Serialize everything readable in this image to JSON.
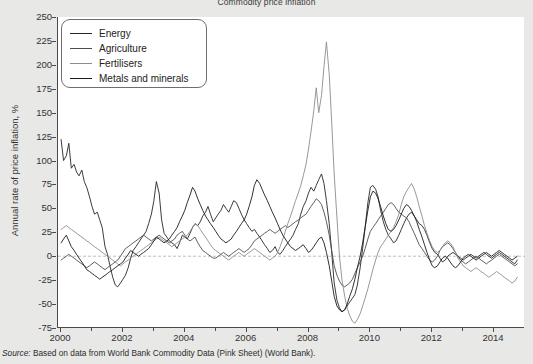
{
  "figure": {
    "title": "Commodity price inflation",
    "source_prefix": "Source:",
    "source_text": " Based on data from World Bank Commodity Data (Pink Sheet) (World Bank)."
  },
  "legend": {
    "position": "top-left",
    "items": [
      {
        "label": "Energy",
        "color": "#262626"
      },
      {
        "label": "Agriculture",
        "color": "#4d4d4d"
      },
      {
        "label": "Fertilisers",
        "color": "#8c8c8c"
      },
      {
        "label": "Metals and minerals",
        "color": "#1a1a1a"
      }
    ]
  },
  "axes": {
    "ylabel": "Annual rate of price inflation, %",
    "xlabel": "",
    "yticks": [
      250,
      225,
      200,
      175,
      150,
      125,
      100,
      75,
      50,
      25,
      0,
      -25,
      -50,
      -75
    ],
    "ytick_labels": [
      "250",
      "225",
      "200",
      "175",
      "150",
      "125",
      "100",
      "75",
      "50",
      "25",
      "0",
      "-25",
      "-50",
      "-75"
    ],
    "xticks": [
      2000,
      2002,
      2004,
      2006,
      2008,
      2010,
      2012,
      2014
    ],
    "xtick_labels": [
      "2000",
      "2002",
      "2004",
      "2006",
      "2008",
      "2010",
      "2012",
      "2014"
    ],
    "xminor": [
      2001,
      2003,
      2005,
      2007,
      2009,
      2011,
      2013
    ],
    "ylim": [
      -75,
      250
    ],
    "xlim": [
      1999.9,
      2015.0
    ],
    "grid": false,
    "zero_line": true,
    "zero_line_color": "#b0b0b0"
  },
  "chart_data": {
    "type": "line",
    "title": "Commodity price inflation",
    "xlabel": "",
    "ylabel": "Annual rate of price inflation, %",
    "ylim": [
      -75,
      250
    ],
    "xlim": [
      1999.9,
      2015.0
    ],
    "grid": false,
    "legend_position": "top-left",
    "x_unit": "year (monthly observations)",
    "x": [
      2000.0,
      2000.08,
      2000.17,
      2000.25,
      2000.33,
      2000.42,
      2000.5,
      2000.58,
      2000.67,
      2000.75,
      2000.83,
      2000.92,
      2001.0,
      2001.08,
      2001.17,
      2001.25,
      2001.33,
      2001.42,
      2001.5,
      2001.58,
      2001.67,
      2001.75,
      2001.83,
      2001.92,
      2002.0,
      2002.08,
      2002.17,
      2002.25,
      2002.33,
      2002.42,
      2002.5,
      2002.58,
      2002.67,
      2002.75,
      2002.83,
      2002.92,
      2003.0,
      2003.08,
      2003.17,
      2003.25,
      2003.33,
      2003.42,
      2003.5,
      2003.58,
      2003.67,
      2003.75,
      2003.83,
      2003.92,
      2004.0,
      2004.08,
      2004.17,
      2004.25,
      2004.33,
      2004.42,
      2004.5,
      2004.58,
      2004.67,
      2004.75,
      2004.83,
      2004.92,
      2005.0,
      2005.08,
      2005.17,
      2005.25,
      2005.33,
      2005.42,
      2005.5,
      2005.58,
      2005.67,
      2005.75,
      2005.83,
      2005.92,
      2006.0,
      2006.08,
      2006.17,
      2006.25,
      2006.33,
      2006.42,
      2006.5,
      2006.58,
      2006.67,
      2006.75,
      2006.83,
      2006.92,
      2007.0,
      2007.08,
      2007.17,
      2007.25,
      2007.33,
      2007.42,
      2007.5,
      2007.58,
      2007.67,
      2007.75,
      2007.83,
      2007.92,
      2008.0,
      2008.08,
      2008.17,
      2008.25,
      2008.33,
      2008.42,
      2008.5,
      2008.58,
      2008.67,
      2008.75,
      2008.83,
      2008.92,
      2009.0,
      2009.08,
      2009.17,
      2009.25,
      2009.33,
      2009.42,
      2009.5,
      2009.58,
      2009.67,
      2009.75,
      2009.83,
      2009.92,
      2010.0,
      2010.08,
      2010.17,
      2010.25,
      2010.33,
      2010.42,
      2010.5,
      2010.58,
      2010.67,
      2010.75,
      2010.83,
      2010.92,
      2011.0,
      2011.08,
      2011.17,
      2011.25,
      2011.33,
      2011.42,
      2011.5,
      2011.58,
      2011.67,
      2011.75,
      2011.83,
      2011.92,
      2012.0,
      2012.08,
      2012.17,
      2012.25,
      2012.33,
      2012.42,
      2012.5,
      2012.58,
      2012.67,
      2012.75,
      2012.83,
      2012.92,
      2013.0,
      2013.08,
      2013.17,
      2013.25,
      2013.33,
      2013.42,
      2013.5,
      2013.58,
      2013.67,
      2013.75,
      2013.83,
      2013.92,
      2014.0,
      2014.08,
      2014.17,
      2014.25,
      2014.33,
      2014.42,
      2014.5,
      2014.58,
      2014.67,
      2014.75
    ],
    "series": [
      {
        "name": "Energy",
        "color": "#262626",
        "values": [
          122,
          100,
          105,
          118,
          92,
          96,
          88,
          84,
          90,
          78,
          72,
          62,
          52,
          44,
          46,
          38,
          30,
          10,
          2,
          -10,
          -22,
          -30,
          -32,
          -28,
          -24,
          -20,
          -12,
          -2,
          6,
          10,
          14,
          18,
          22,
          26,
          34,
          44,
          58,
          78,
          66,
          38,
          24,
          20,
          16,
          14,
          12,
          8,
          14,
          22,
          20,
          18,
          24,
          30,
          34,
          32,
          36,
          42,
          46,
          52,
          44,
          36,
          40,
          44,
          48,
          54,
          50,
          46,
          52,
          58,
          56,
          50,
          44,
          38,
          34,
          30,
          26,
          28,
          24,
          20,
          16,
          12,
          8,
          4,
          6,
          10,
          4,
          2,
          6,
          10,
          14,
          18,
          22,
          28,
          34,
          44,
          52,
          58,
          66,
          72,
          68,
          74,
          80,
          86,
          76,
          58,
          34,
          4,
          -28,
          -46,
          -54,
          -58,
          -56,
          -52,
          -48,
          -44,
          -40,
          -30,
          -12,
          8,
          30,
          56,
          72,
          74,
          70,
          62,
          48,
          36,
          28,
          22,
          18,
          14,
          16,
          22,
          28,
          34,
          40,
          44,
          46,
          42,
          38,
          34,
          32,
          28,
          22,
          14,
          8,
          4,
          2,
          -2,
          -6,
          -4,
          0,
          2,
          4,
          2,
          0,
          -2,
          -4,
          -2,
          0,
          2,
          0,
          -2,
          0,
          2,
          4,
          2,
          0,
          -2,
          0,
          2,
          4,
          2,
          0,
          -2,
          -4,
          -6,
          -8,
          -4
        ]
      },
      {
        "name": "Agriculture",
        "color": "#4d4d4d",
        "values": [
          -4,
          -2,
          0,
          2,
          0,
          -2,
          -4,
          -6,
          -8,
          -10,
          -12,
          -10,
          -8,
          -6,
          -8,
          -10,
          -12,
          -14,
          -12,
          -10,
          -8,
          -6,
          -4,
          0,
          4,
          8,
          10,
          12,
          14,
          16,
          18,
          20,
          22,
          20,
          18,
          16,
          18,
          20,
          22,
          20,
          18,
          16,
          14,
          16,
          18,
          22,
          24,
          26,
          22,
          18,
          16,
          18,
          20,
          14,
          10,
          6,
          4,
          2,
          0,
          -2,
          -2,
          0,
          2,
          4,
          2,
          0,
          2,
          4,
          6,
          8,
          6,
          4,
          6,
          8,
          12,
          16,
          18,
          20,
          22,
          24,
          26,
          28,
          26,
          24,
          26,
          28,
          30,
          32,
          30,
          32,
          34,
          36,
          38,
          40,
          42,
          44,
          48,
          52,
          56,
          60,
          58,
          54,
          46,
          36,
          22,
          6,
          -10,
          -20,
          -26,
          -30,
          -32,
          -30,
          -28,
          -24,
          -18,
          -12,
          -6,
          0,
          8,
          18,
          26,
          30,
          34,
          38,
          42,
          46,
          50,
          54,
          56,
          54,
          50,
          46,
          44,
          42,
          40,
          36,
          30,
          24,
          18,
          12,
          8,
          4,
          0,
          -4,
          -6,
          -4,
          0,
          6,
          10,
          12,
          14,
          12,
          8,
          4,
          0,
          -4,
          -6,
          -8,
          -6,
          -4,
          -2,
          0,
          -2,
          -4,
          -6,
          -8,
          -6,
          -4,
          -2,
          0,
          2,
          0,
          -2,
          -4,
          -6,
          -8,
          -10,
          -8
        ]
      },
      {
        "name": "Fertilisers",
        "color": "#8c8c8c",
        "values": [
          28,
          30,
          32,
          30,
          28,
          26,
          24,
          22,
          20,
          18,
          16,
          14,
          12,
          10,
          8,
          6,
          4,
          2,
          0,
          -2,
          -4,
          -6,
          -8,
          -10,
          -8,
          -6,
          -4,
          -2,
          0,
          2,
          4,
          6,
          8,
          10,
          12,
          14,
          16,
          18,
          20,
          18,
          16,
          14,
          12,
          10,
          12,
          14,
          16,
          18,
          20,
          22,
          26,
          30,
          34,
          32,
          28,
          24,
          20,
          16,
          12,
          8,
          6,
          4,
          2,
          0,
          -2,
          -4,
          -2,
          0,
          2,
          4,
          2,
          0,
          2,
          4,
          6,
          8,
          6,
          4,
          2,
          0,
          -2,
          -4,
          -2,
          0,
          4,
          10,
          18,
          26,
          34,
          42,
          50,
          58,
          66,
          74,
          84,
          96,
          112,
          130,
          152,
          176,
          150,
          168,
          198,
          224,
          190,
          140,
          86,
          40,
          0,
          -24,
          -42,
          -54,
          -62,
          -68,
          -70,
          -66,
          -60,
          -52,
          -44,
          -34,
          -24,
          -14,
          -4,
          4,
          10,
          14,
          18,
          22,
          26,
          30,
          36,
          44,
          54,
          62,
          68,
          72,
          76,
          70,
          62,
          52,
          42,
          32,
          24,
          16,
          10,
          6,
          4,
          6,
          10,
          14,
          16,
          14,
          10,
          4,
          -2,
          -6,
          -10,
          -12,
          -14,
          -16,
          -14,
          -12,
          -14,
          -16,
          -18,
          -20,
          -22,
          -20,
          -18,
          -16,
          -18,
          -20,
          -22,
          -24,
          -26,
          -28,
          -26,
          -22
        ]
      },
      {
        "name": "Metals and minerals",
        "color": "#1a1a1a",
        "values": [
          14,
          18,
          22,
          16,
          10,
          6,
          2,
          -2,
          -6,
          -10,
          -14,
          -16,
          -18,
          -20,
          -22,
          -24,
          -22,
          -20,
          -18,
          -16,
          -14,
          -12,
          -10,
          -8,
          -6,
          -2,
          2,
          6,
          4,
          2,
          0,
          2,
          4,
          6,
          8,
          12,
          16,
          20,
          18,
          16,
          14,
          16,
          18,
          22,
          26,
          30,
          36,
          42,
          48,
          56,
          64,
          72,
          68,
          60,
          54,
          48,
          42,
          38,
          34,
          30,
          26,
          22,
          18,
          16,
          14,
          16,
          18,
          22,
          26,
          30,
          34,
          38,
          44,
          52,
          62,
          74,
          80,
          76,
          70,
          64,
          58,
          52,
          46,
          40,
          34,
          28,
          22,
          18,
          14,
          10,
          8,
          6,
          8,
          10,
          12,
          8,
          4,
          6,
          10,
          14,
          18,
          20,
          14,
          4,
          -10,
          -26,
          -42,
          -52,
          -56,
          -58,
          -56,
          -50,
          -42,
          -34,
          -24,
          -12,
          0,
          14,
          30,
          48,
          62,
          68,
          66,
          60,
          52,
          42,
          34,
          28,
          26,
          28,
          32,
          38,
          44,
          50,
          54,
          52,
          48,
          42,
          36,
          28,
          20,
          12,
          4,
          -4,
          -10,
          -12,
          -10,
          -6,
          -2,
          0,
          -2,
          -6,
          -10,
          -12,
          -10,
          -6,
          -2,
          0,
          2,
          0,
          -2,
          -4,
          -2,
          0,
          2,
          4,
          2,
          0,
          2,
          4,
          6,
          4,
          2,
          0,
          -2,
          -4,
          -2,
          0
        ]
      }
    ]
  }
}
